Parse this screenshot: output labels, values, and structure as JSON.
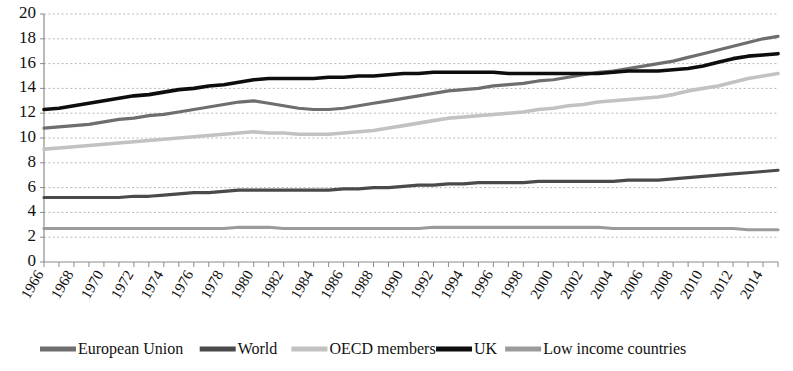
{
  "title": {
    "text": "",
    "visible_note": "cropped"
  },
  "chart_data": {
    "type": "line",
    "title": "",
    "xlabel": "",
    "ylabel": "",
    "xlim": [
      1966,
      2015
    ],
    "ylim": [
      0,
      20
    ],
    "ytick_step": 2,
    "xtick_step": 2,
    "grid": true,
    "legend_position": "bottom",
    "yticks": [
      "0",
      "2",
      "4",
      "6",
      "8",
      "10",
      "12",
      "14",
      "16",
      "18",
      "20"
    ],
    "xticks": [
      "1966",
      "1968",
      "1970",
      "1972",
      "1974",
      "1976",
      "1978",
      "1980",
      "1982",
      "1984",
      "1986",
      "1988",
      "1990",
      "1992",
      "1994",
      "1996",
      "1998",
      "2000",
      "2002",
      "2004",
      "2006",
      "2008",
      "2010",
      "2012",
      "2014"
    ],
    "x": [
      1966,
      1967,
      1968,
      1969,
      1970,
      1971,
      1972,
      1973,
      1974,
      1975,
      1976,
      1977,
      1978,
      1979,
      1980,
      1981,
      1982,
      1983,
      1984,
      1985,
      1986,
      1987,
      1988,
      1989,
      1990,
      1991,
      1992,
      1993,
      1994,
      1995,
      1996,
      1997,
      1998,
      1999,
      2000,
      2001,
      2002,
      2003,
      2004,
      2005,
      2006,
      2007,
      2008,
      2009,
      2010,
      2011,
      2012,
      2013,
      2014,
      2015
    ],
    "series": [
      {
        "name": "European Union",
        "color": "#6e6e6e",
        "width": 3.2,
        "values": [
          10.8,
          10.9,
          11.0,
          11.1,
          11.3,
          11.5,
          11.6,
          11.8,
          11.9,
          12.1,
          12.3,
          12.5,
          12.7,
          12.9,
          13.0,
          12.8,
          12.6,
          12.4,
          12.3,
          12.3,
          12.4,
          12.6,
          12.8,
          13.0,
          13.2,
          13.4,
          13.6,
          13.8,
          13.9,
          14.0,
          14.2,
          14.3,
          14.4,
          14.6,
          14.7,
          14.9,
          15.1,
          15.3,
          15.4,
          15.6,
          15.8,
          16.0,
          16.2,
          16.5,
          16.8,
          17.1,
          17.4,
          17.7,
          18.0,
          18.2
        ]
      },
      {
        "name": "World",
        "color": "#4a4a4a",
        "width": 3.2,
        "values": [
          5.2,
          5.2,
          5.2,
          5.2,
          5.2,
          5.2,
          5.3,
          5.3,
          5.4,
          5.5,
          5.6,
          5.6,
          5.7,
          5.8,
          5.8,
          5.8,
          5.8,
          5.8,
          5.8,
          5.8,
          5.9,
          5.9,
          6.0,
          6.0,
          6.1,
          6.2,
          6.2,
          6.3,
          6.3,
          6.4,
          6.4,
          6.4,
          6.4,
          6.5,
          6.5,
          6.5,
          6.5,
          6.5,
          6.5,
          6.6,
          6.6,
          6.6,
          6.7,
          6.8,
          6.9,
          7.0,
          7.1,
          7.2,
          7.3,
          7.4
        ]
      },
      {
        "name": "OECD members",
        "color": "#c2c2c2",
        "width": 3.6,
        "values": [
          9.1,
          9.2,
          9.3,
          9.4,
          9.5,
          9.6,
          9.7,
          9.8,
          9.9,
          10.0,
          10.1,
          10.2,
          10.3,
          10.4,
          10.5,
          10.4,
          10.4,
          10.3,
          10.3,
          10.3,
          10.4,
          10.5,
          10.6,
          10.8,
          11.0,
          11.2,
          11.4,
          11.6,
          11.7,
          11.8,
          11.9,
          12.0,
          12.1,
          12.3,
          12.4,
          12.6,
          12.7,
          12.9,
          13.0,
          13.1,
          13.2,
          13.3,
          13.5,
          13.8,
          14.0,
          14.2,
          14.5,
          14.8,
          15.0,
          15.2
        ]
      },
      {
        "name": "UK",
        "color": "#0d0d0d",
        "width": 3.6,
        "values": [
          12.3,
          12.4,
          12.6,
          12.8,
          13.0,
          13.2,
          13.4,
          13.5,
          13.7,
          13.9,
          14.0,
          14.2,
          14.3,
          14.5,
          14.7,
          14.8,
          14.8,
          14.8,
          14.8,
          14.9,
          14.9,
          15.0,
          15.0,
          15.1,
          15.2,
          15.2,
          15.3,
          15.3,
          15.3,
          15.3,
          15.3,
          15.2,
          15.2,
          15.2,
          15.2,
          15.2,
          15.2,
          15.2,
          15.3,
          15.4,
          15.4,
          15.4,
          15.5,
          15.6,
          15.8,
          16.1,
          16.4,
          16.6,
          16.7,
          16.8
        ]
      },
      {
        "name": "Low income countries",
        "color": "#9b9b9b",
        "width": 3.2,
        "values": [
          2.7,
          2.7,
          2.7,
          2.7,
          2.7,
          2.7,
          2.7,
          2.7,
          2.7,
          2.7,
          2.7,
          2.7,
          2.7,
          2.8,
          2.8,
          2.8,
          2.7,
          2.7,
          2.7,
          2.7,
          2.7,
          2.7,
          2.7,
          2.7,
          2.7,
          2.7,
          2.8,
          2.8,
          2.8,
          2.8,
          2.8,
          2.8,
          2.8,
          2.8,
          2.8,
          2.8,
          2.8,
          2.8,
          2.7,
          2.7,
          2.7,
          2.7,
          2.7,
          2.7,
          2.7,
          2.7,
          2.7,
          2.6,
          2.6,
          2.6
        ]
      }
    ]
  },
  "legend": {
    "items": [
      {
        "label": "European Union",
        "color": "#6e6e6e"
      },
      {
        "label": "World",
        "color": "#4a4a4a"
      },
      {
        "label": "OECD members",
        "color": "#c2c2c2"
      },
      {
        "label": "UK",
        "color": "#0d0d0d"
      },
      {
        "label": "Low income countries",
        "color": "#9b9b9b"
      }
    ]
  }
}
